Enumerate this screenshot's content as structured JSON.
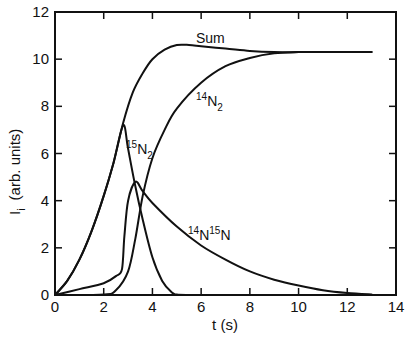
{
  "chart_data": {
    "type": "line",
    "title": "",
    "xlabel": "t (s)",
    "ylabel": "I_i (arb. units)",
    "xlim": [
      0,
      14
    ],
    "ylim": [
      0,
      12
    ],
    "xticks": [
      0,
      2,
      4,
      6,
      8,
      10,
      12,
      14
    ],
    "yticks": [
      0,
      2,
      4,
      6,
      8,
      10,
      12
    ],
    "grid": false,
    "legend": "inline labels",
    "series": [
      {
        "name": "15N2",
        "label_main": "N",
        "label_sup": "15",
        "label_sub": "2",
        "x": [
          0,
          0.5,
          1.0,
          1.5,
          2.0,
          2.4,
          2.8,
          3.0,
          3.3,
          3.6,
          4.0,
          4.4,
          4.8,
          5.0,
          5.5
        ],
        "y": [
          0,
          0.6,
          1.5,
          2.7,
          4.2,
          5.6,
          7.2,
          6.2,
          4.6,
          3.2,
          1.6,
          0.6,
          0.1,
          0.02,
          0
        ]
      },
      {
        "name": "14N15N",
        "label_main": "N",
        "label_sup_1": "14",
        "label_sup_2": "15",
        "x": [
          0,
          1.0,
          2.0,
          2.5,
          2.75,
          2.85,
          3.0,
          3.3,
          3.6,
          4.0,
          5.0,
          6.0,
          7.0,
          8.0,
          9.0,
          10.0,
          11.0,
          12.0,
          13.0
        ],
        "y": [
          0,
          0.25,
          0.5,
          0.8,
          1.1,
          2.5,
          4.0,
          4.8,
          4.4,
          3.9,
          2.9,
          2.1,
          1.5,
          1.0,
          0.65,
          0.4,
          0.2,
          0.08,
          0.02
        ]
      },
      {
        "name": "14N2",
        "label_main": "N",
        "label_sup": "14",
        "label_sub": "2",
        "x": [
          0,
          2.0,
          2.5,
          3.0,
          3.3,
          3.6,
          4.0,
          4.5,
          5.0,
          6.0,
          7.0,
          8.0,
          9.0,
          10.0,
          11.0,
          12.0,
          13.0
        ],
        "y": [
          0,
          0.02,
          0.2,
          1.0,
          2.4,
          4.2,
          5.8,
          7.0,
          7.9,
          9.0,
          9.7,
          10.05,
          10.25,
          10.3,
          10.3,
          10.3,
          10.3
        ]
      },
      {
        "name": "Sum",
        "x": [
          0,
          0.5,
          1.0,
          1.5,
          2.0,
          2.4,
          2.8,
          3.2,
          3.6,
          4.0,
          4.5,
          5.0,
          5.5,
          6.0,
          7.0,
          8.0,
          9.0,
          10.0,
          11.0,
          12.0,
          13.0
        ],
        "y": [
          0,
          0.6,
          1.5,
          2.7,
          4.2,
          5.6,
          7.3,
          8.6,
          9.4,
          10.0,
          10.4,
          10.6,
          10.6,
          10.55,
          10.45,
          10.35,
          10.3,
          10.3,
          10.3,
          10.3,
          10.3
        ]
      }
    ],
    "annotations": [
      {
        "text": "Sum",
        "x": 6.3,
        "y": 10.8
      },
      {
        "text": "14N2",
        "x": 8.0,
        "y": 8.2
      },
      {
        "text": "15N2",
        "x": 3.0,
        "y": 6.3
      },
      {
        "text": "14N15N",
        "x": 7.6,
        "y": 3.1
      }
    ]
  },
  "axes": {
    "x_title": "t (s)",
    "y_title_main": "I",
    "y_title_sub": "i",
    "y_title_rest": "(arb. units)",
    "x_tick_labels": [
      "0",
      "2",
      "4",
      "6",
      "8",
      "10",
      "12",
      "14"
    ],
    "y_tick_labels": [
      "0",
      "2",
      "4",
      "6",
      "8",
      "10",
      "12"
    ]
  },
  "labels": {
    "sum": "Sum",
    "n14n2_sup": "14",
    "n14n2_main": "N",
    "n14n2_sub": "2",
    "n15n2_sup": "15",
    "n15n2_main": "N",
    "n15n2_sub": "2",
    "mixed_sup1": "14",
    "mixed_main1": "N",
    "mixed_sup2": "15",
    "mixed_main2": "N"
  }
}
